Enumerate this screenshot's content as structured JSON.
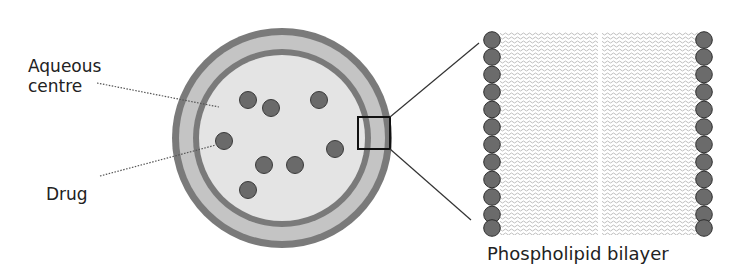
{
  "labels": {
    "aqueous_centre": "Aqueous centre",
    "aqueous_line1": "Aqueous",
    "aqueous_line2": "centre",
    "drug": "Drug",
    "bilayer": "Phospholipid bilayer"
  },
  "liposome": {
    "outer_ring_color": "#7a7a7a",
    "bilayer_fill_color": "#c4c4c4",
    "inner_ring_color": "#7a7a7a",
    "aqueous_fill_color": "#e4e4e4",
    "drug_color": "#6a6a6a",
    "drug_count": 8
  },
  "bilayer_detail": {
    "heads_per_side": 12,
    "head_color": "#6b6b6b",
    "tail_color": "#c8c8c8"
  },
  "colors": {
    "text": "#222222",
    "leader_line": "#555555",
    "zoom_box": "#111111"
  }
}
